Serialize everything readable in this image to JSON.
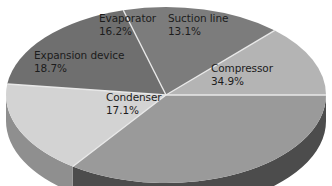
{
  "chart_data": {
    "type": "pie",
    "title": "",
    "subtitle": "",
    "xlabel": "",
    "ylabel": "",
    "legend": "none",
    "grid": false,
    "three_d": true,
    "value_unit": "%",
    "categories": [
      "Compressor",
      "Suction line",
      "Evaporator",
      "Expansion device",
      "Condenser"
    ],
    "values": [
      34.9,
      13.1,
      16.2,
      18.7,
      17.1
    ],
    "slices": [
      {
        "label": "Compressor",
        "value": 34.9,
        "value_text": "34.9%",
        "color": "#9a9a9a",
        "side_color": "#4c4c4c",
        "start_angle": 0,
        "end_angle": 125.64
      },
      {
        "label": "Condenser",
        "value": 17.1,
        "value_text": "17.1%",
        "color": "#d3d3d3",
        "side_color": "#8f8f8f",
        "start_angle": 125.64,
        "end_angle": 187.2
      },
      {
        "label": "Expansion device",
        "value": 18.7,
        "value_text": "18.7%",
        "color": "#6f6f6f",
        "side_color": "#4a4a4a",
        "start_angle": 187.2,
        "end_angle": 254.52
      },
      {
        "label": "Evaporator",
        "value": 16.2,
        "value_text": "16.2%",
        "color": "#7c7c7c",
        "side_color": "#4a4a4a",
        "start_angle": 254.52,
        "end_angle": 312.84
      },
      {
        "label": "Suction line",
        "value": 13.1,
        "value_text": "13.1%",
        "color": "#b4b4b4",
        "side_color": "#6b6b6b",
        "start_angle": 312.84,
        "end_angle": 360
      }
    ],
    "background_color": "#ffffff",
    "label_color": "#1c1c1c",
    "separator_color": "#e8e8e8"
  },
  "labels": {
    "compressor": {
      "name": "Compressor",
      "pct": "34.9%"
    },
    "suction_line": {
      "name": "Suction line",
      "pct": "13.1%"
    },
    "evaporator": {
      "name": "Evaporator",
      "pct": "16.2%"
    },
    "expansion_device": {
      "name": "Expansion device",
      "pct": "18.7%"
    },
    "condenser": {
      "name": "Condenser",
      "pct": "17.1%"
    }
  }
}
